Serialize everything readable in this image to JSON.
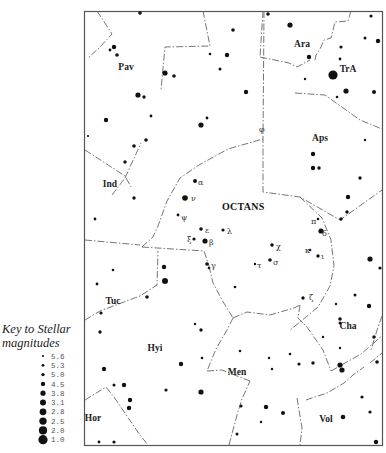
{
  "key": {
    "title_line1": "Key to Stellar",
    "title_line2": "magnitudes",
    "entries": [
      {
        "mag": "5.6",
        "r": 1.1
      },
      {
        "mag": "5.3",
        "r": 1.4
      },
      {
        "mag": "5.0",
        "r": 1.7
      },
      {
        "mag": "4.5",
        "r": 2.2
      },
      {
        "mag": "3.8",
        "r": 2.6
      },
      {
        "mag": "3.1",
        "r": 3.0
      },
      {
        "mag": "2.8",
        "r": 3.4
      },
      {
        "mag": "2.5",
        "r": 3.7
      },
      {
        "mag": "2.0",
        "r": 4.1
      },
      {
        "mag": "1.0",
        "r": 4.6
      }
    ]
  },
  "chart": {
    "main_constellation": "OCTANS",
    "constellations": [
      {
        "name": "Pav",
        "x": 126,
        "y": 70
      },
      {
        "name": "Ara",
        "x": 302,
        "y": 47
      },
      {
        "name": "TrA",
        "x": 348,
        "y": 72
      },
      {
        "name": "Aps",
        "x": 320,
        "y": 141
      },
      {
        "name": "Ind",
        "x": 110,
        "y": 187
      },
      {
        "name": "Tuc",
        "x": 113,
        "y": 304
      },
      {
        "name": "Hyi",
        "x": 155,
        "y": 351
      },
      {
        "name": "Cha",
        "x": 348,
        "y": 329
      },
      {
        "name": "Men",
        "x": 237,
        "y": 375
      },
      {
        "name": "Hor",
        "x": 93,
        "y": 421
      },
      {
        "name": "Vol",
        "x": 326,
        "y": 422
      }
    ],
    "greek_labels": [
      {
        "letter": "α",
        "x": 198,
        "y": 185
      },
      {
        "letter": "ν",
        "x": 191,
        "y": 201
      },
      {
        "letter": "ψ",
        "x": 181,
        "y": 220
      },
      {
        "letter": "ε",
        "x": 205,
        "y": 233
      },
      {
        "letter": "λ",
        "x": 227,
        "y": 234
      },
      {
        "letter": "ξ",
        "x": 187,
        "y": 242
      },
      {
        "letter": "β",
        "x": 209,
        "y": 245
      },
      {
        "letter": "γ",
        "x": 211,
        "y": 268
      },
      {
        "letter": "χ",
        "x": 276,
        "y": 249
      },
      {
        "letter": "σ",
        "x": 273,
        "y": 265
      },
      {
        "letter": "τ",
        "x": 257,
        "y": 268
      },
      {
        "letter": "π",
        "x": 311,
        "y": 224
      },
      {
        "letter": "δ",
        "x": 322,
        "y": 236
      },
      {
        "letter": "κ",
        "x": 305,
        "y": 253
      },
      {
        "letter": "ι",
        "x": 321,
        "y": 259
      },
      {
        "letter": "ζ",
        "x": 309,
        "y": 300
      },
      {
        "letter": "φ",
        "x": 259,
        "y": 132
      }
    ],
    "stars": [
      {
        "x": 140,
        "y": 13,
        "r": 1.8
      },
      {
        "x": 114,
        "y": 47,
        "r": 2.2
      },
      {
        "x": 110,
        "y": 50,
        "r": 1.4
      },
      {
        "x": 117,
        "y": 55,
        "r": 1.8
      },
      {
        "x": 165,
        "y": 73,
        "r": 2.6
      },
      {
        "x": 174,
        "y": 76,
        "r": 1.8
      },
      {
        "x": 138,
        "y": 95,
        "r": 2.6
      },
      {
        "x": 144,
        "y": 97,
        "r": 1.7
      },
      {
        "x": 151,
        "y": 116,
        "r": 1.4
      },
      {
        "x": 106,
        "y": 120,
        "r": 2.2
      },
      {
        "x": 88,
        "y": 136,
        "r": 1.1
      },
      {
        "x": 146,
        "y": 140,
        "r": 1.8
      },
      {
        "x": 134,
        "y": 146,
        "r": 1.8
      },
      {
        "x": 201,
        "y": 125,
        "r": 2.6
      },
      {
        "x": 207,
        "y": 118,
        "r": 1.4
      },
      {
        "x": 210,
        "y": 54,
        "r": 1.3
      },
      {
        "x": 220,
        "y": 69,
        "r": 1.5
      },
      {
        "x": 227,
        "y": 55,
        "r": 2.2
      },
      {
        "x": 233,
        "y": 30,
        "r": 1.8
      },
      {
        "x": 268,
        "y": 14,
        "r": 1.8
      },
      {
        "x": 290,
        "y": 25,
        "r": 2.6
      },
      {
        "x": 309,
        "y": 57,
        "r": 2.2
      },
      {
        "x": 341,
        "y": 47,
        "r": 1.6
      },
      {
        "x": 365,
        "y": 38,
        "r": 1.5
      },
      {
        "x": 378,
        "y": 41,
        "r": 2.2
      },
      {
        "x": 371,
        "y": 16,
        "r": 1.6
      },
      {
        "x": 340,
        "y": 59,
        "r": 1.4
      },
      {
        "x": 333,
        "y": 75,
        "r": 4.6
      },
      {
        "x": 305,
        "y": 79,
        "r": 1.2
      },
      {
        "x": 346,
        "y": 91,
        "r": 2.6
      },
      {
        "x": 337,
        "y": 97,
        "r": 1.3
      },
      {
        "x": 374,
        "y": 92,
        "r": 2.0
      },
      {
        "x": 246,
        "y": 92,
        "r": 2.2
      },
      {
        "x": 365,
        "y": 140,
        "r": 1.2
      },
      {
        "x": 313,
        "y": 154,
        "r": 2.2
      },
      {
        "x": 313,
        "y": 168,
        "r": 2.2
      },
      {
        "x": 319,
        "y": 168,
        "r": 1.7
      },
      {
        "x": 360,
        "y": 178,
        "r": 1.7
      },
      {
        "x": 348,
        "y": 197,
        "r": 2.2
      },
      {
        "x": 347,
        "y": 212,
        "r": 1.7
      },
      {
        "x": 341,
        "y": 219,
        "r": 1.7
      },
      {
        "x": 125,
        "y": 162,
        "r": 1.7
      },
      {
        "x": 134,
        "y": 198,
        "r": 1.7
      },
      {
        "x": 95,
        "y": 219,
        "r": 1.4
      },
      {
        "x": 195,
        "y": 181,
        "r": 2.0
      },
      {
        "x": 185,
        "y": 198,
        "r": 2.8
      },
      {
        "x": 178,
        "y": 215,
        "r": 1.4
      },
      {
        "x": 201,
        "y": 229,
        "r": 1.8
      },
      {
        "x": 223,
        "y": 230,
        "r": 1.6
      },
      {
        "x": 194,
        "y": 239,
        "r": 1.6
      },
      {
        "x": 205,
        "y": 241,
        "r": 2.6
      },
      {
        "x": 207,
        "y": 264,
        "r": 1.8
      },
      {
        "x": 209,
        "y": 268,
        "r": 1.3
      },
      {
        "x": 164,
        "y": 267,
        "r": 2.2
      },
      {
        "x": 165,
        "y": 281,
        "r": 3.0
      },
      {
        "x": 113,
        "y": 270,
        "r": 1.3
      },
      {
        "x": 97,
        "y": 284,
        "r": 1.4
      },
      {
        "x": 147,
        "y": 297,
        "r": 1.8
      },
      {
        "x": 101,
        "y": 313,
        "r": 1.6
      },
      {
        "x": 100,
        "y": 332,
        "r": 1.7
      },
      {
        "x": 272,
        "y": 245,
        "r": 1.8
      },
      {
        "x": 270,
        "y": 260,
        "r": 1.8
      },
      {
        "x": 255,
        "y": 264,
        "r": 1.2
      },
      {
        "x": 235,
        "y": 287,
        "r": 1.3
      },
      {
        "x": 318,
        "y": 219,
        "r": 1.3
      },
      {
        "x": 321,
        "y": 231,
        "r": 2.6
      },
      {
        "x": 310,
        "y": 250,
        "r": 1.3
      },
      {
        "x": 318,
        "y": 256,
        "r": 1.7
      },
      {
        "x": 370,
        "y": 259,
        "r": 2.6
      },
      {
        "x": 380,
        "y": 268,
        "r": 1.6
      },
      {
        "x": 303,
        "y": 298,
        "r": 1.7
      },
      {
        "x": 355,
        "y": 295,
        "r": 1.5
      },
      {
        "x": 369,
        "y": 306,
        "r": 2.2
      },
      {
        "x": 336,
        "y": 304,
        "r": 1.2
      },
      {
        "x": 340,
        "y": 319,
        "r": 1.8
      },
      {
        "x": 340,
        "y": 323,
        "r": 1.5
      },
      {
        "x": 374,
        "y": 337,
        "r": 1.7
      },
      {
        "x": 323,
        "y": 337,
        "r": 1.2
      },
      {
        "x": 340,
        "y": 348,
        "r": 1.2
      },
      {
        "x": 340,
        "y": 365,
        "r": 2.6
      },
      {
        "x": 342,
        "y": 370,
        "r": 2.6
      },
      {
        "x": 377,
        "y": 362,
        "r": 1.8
      },
      {
        "x": 313,
        "y": 363,
        "r": 1.7
      },
      {
        "x": 299,
        "y": 364,
        "r": 1.6
      },
      {
        "x": 290,
        "y": 354,
        "r": 1.3
      },
      {
        "x": 269,
        "y": 358,
        "r": 1.2
      },
      {
        "x": 272,
        "y": 369,
        "r": 1.2
      },
      {
        "x": 240,
        "y": 351,
        "r": 1.3
      },
      {
        "x": 266,
        "y": 407,
        "r": 2.2
      },
      {
        "x": 241,
        "y": 406,
        "r": 1.6
      },
      {
        "x": 283,
        "y": 413,
        "r": 2.0
      },
      {
        "x": 261,
        "y": 422,
        "r": 1.2
      },
      {
        "x": 237,
        "y": 434,
        "r": 1.5
      },
      {
        "x": 362,
        "y": 397,
        "r": 1.6
      },
      {
        "x": 343,
        "y": 417,
        "r": 2.3
      },
      {
        "x": 370,
        "y": 412,
        "r": 1.6
      },
      {
        "x": 376,
        "y": 442,
        "r": 2.2
      },
      {
        "x": 201,
        "y": 330,
        "r": 1.7
      },
      {
        "x": 181,
        "y": 364,
        "r": 2.2
      },
      {
        "x": 202,
        "y": 358,
        "r": 1.3
      },
      {
        "x": 195,
        "y": 324,
        "r": 1.2
      },
      {
        "x": 166,
        "y": 390,
        "r": 1.6
      },
      {
        "x": 201,
        "y": 392,
        "r": 2.6
      },
      {
        "x": 104,
        "y": 369,
        "r": 2.2
      },
      {
        "x": 114,
        "y": 385,
        "r": 1.5
      },
      {
        "x": 124,
        "y": 385,
        "r": 2.2
      },
      {
        "x": 130,
        "y": 400,
        "r": 2.2
      },
      {
        "x": 129,
        "y": 408,
        "r": 2.2
      },
      {
        "x": 99,
        "y": 442,
        "r": 1.4
      },
      {
        "x": 114,
        "y": 442,
        "r": 1.6
      }
    ],
    "boundaries": [
      "M97,11 L112,34 L99,48 L88,58",
      "M85,150 L125,176 L131,187",
      "M203,11 L210,46 L165,47 L161,90",
      "M85,240 L140,245",
      "M112,195 L125,178 M125,178 L141,143",
      "M142,247 L153,237 L158,226 L167,201 L180,178 L199,165 L228,149 L263,139",
      "M264,11 L263,140 L263,192 L300,197 L340,220 L382,190",
      "M263,11 L260,57 M260,57 L289,63 L297,67 L310,60",
      "M315,60 L316,55 L320,49 L324,40 L331,38 L335,22 L348,21 L351,11",
      "M295,93 L325,95 L360,120 L382,129",
      "M142,247 L204,251 L209,266",
      "M209,266 L213,283 L222,300 L233,318",
      "M233,318 L227,330 L216,349 L207,371 M207,371 L222,370 L232,374",
      "M233,318 L247,312 L270,315 L294,308 L300,305",
      "M300,197 L322,218 L331,240 L334,266 L330,286 L318,307 L300,322 L290,330",
      "M300,305 L298,318 L307,327 L323,350 L331,371",
      "M331,371 L361,354 L383,335",
      "M85,400 L106,387 L114,397 L131,422 L140,435 L148,445",
      "M85,320 L100,311 L140,296 L157,285 L158,251",
      "M229,445 L237,415 L242,399 L250,381 M232,374 L250,381",
      "M306,400 L327,393 L344,383 L353,375 L364,367",
      "M370,363 L382,353",
      "M297,398 L302,428 L300,445",
      "M382,316 L378,327 L371,350"
    ]
  }
}
